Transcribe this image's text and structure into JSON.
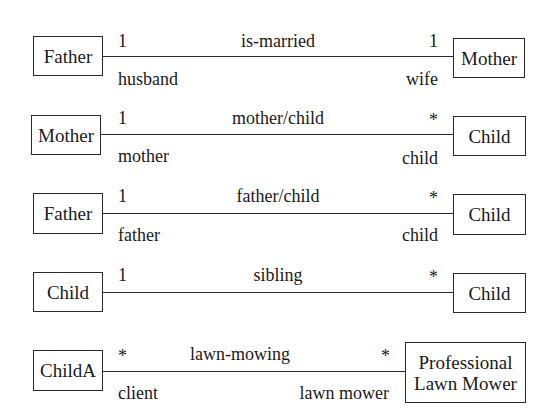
{
  "diagram": {
    "type": "UML class associations",
    "associations": [
      {
        "left_class": "Father",
        "right_class": "Mother",
        "name": "is-married",
        "left_multiplicity": "1",
        "right_multiplicity": "1",
        "left_role": "husband",
        "right_role": "wife"
      },
      {
        "left_class": "Mother",
        "right_class": "Child",
        "name": "mother/child",
        "left_multiplicity": "1",
        "right_multiplicity": "*",
        "left_role": "mother",
        "right_role": "child"
      },
      {
        "left_class": "Father",
        "right_class": "Child",
        "name": "father/child",
        "left_multiplicity": "1",
        "right_multiplicity": "*",
        "left_role": "father",
        "right_role": "child"
      },
      {
        "left_class": "Child",
        "right_class": "Child",
        "name": "sibling",
        "left_multiplicity": "1",
        "right_multiplicity": "*",
        "left_role": "",
        "right_role": ""
      },
      {
        "left_class": "ChildA",
        "right_class_line1": "Professional",
        "right_class_line2": "Lawn Mower",
        "name": "lawn-mowing",
        "left_multiplicity": "*",
        "right_multiplicity": "*",
        "left_role": "client",
        "right_role": "lawn mower"
      }
    ]
  },
  "colors": {
    "line": "#2a2a2a",
    "text": "#1a1a1a",
    "background": "#ffffff"
  }
}
